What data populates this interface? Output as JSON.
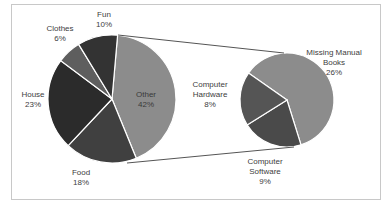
{
  "chart_data": {
    "type": "pie",
    "subtype": "pie-of-pie",
    "title": "",
    "primary": {
      "categories": [
        "Other",
        "Food",
        "House",
        "Clothes",
        "Fun"
      ],
      "values": [
        42,
        18,
        23,
        6,
        10
      ],
      "labels": [
        "42%",
        "18%",
        "23%",
        "6%",
        "10%"
      ],
      "colors": [
        "#8c8c8c",
        "#404040",
        "#2b2b2b",
        "#5e5e5e",
        "#333333"
      ]
    },
    "secondary": {
      "parent": "Other",
      "categories": [
        "Missing Manual Books",
        "Computer Software",
        "Computer Hardware"
      ],
      "values": [
        26,
        9,
        8
      ],
      "labels": [
        "26%",
        "9%",
        "8%"
      ],
      "colors": [
        "#8c8c8c",
        "#4a4a4a",
        "#555555"
      ]
    },
    "legend": "none",
    "data_labels": "category and percentage"
  },
  "labels": {
    "fun": {
      "name": "Fun",
      "pct": "10%"
    },
    "clothes": {
      "name": "Clothes",
      "pct": "6%"
    },
    "house": {
      "name": "House",
      "pct": "23%"
    },
    "food": {
      "name": "Food",
      "pct": "18%"
    },
    "other": {
      "name": "Other",
      "pct": "42%"
    },
    "books": {
      "name1": "Missing Manual",
      "name2": "Books",
      "pct": "26%"
    },
    "hardware": {
      "name1": "Computer",
      "name2": "Hardware",
      "pct": "8%"
    },
    "software": {
      "name1": "Computer",
      "name2": "Software",
      "pct": "9%"
    }
  }
}
